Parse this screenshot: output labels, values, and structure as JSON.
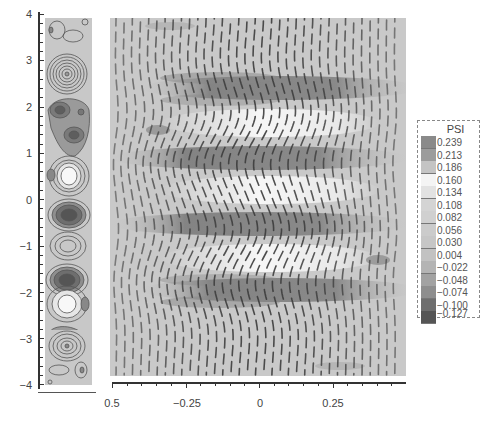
{
  "chart_data": [
    {
      "type": "heatmap",
      "title": "",
      "description": "Narrow contour plot of PSI (streamfunction) with closed contour vortices alternating sign along y",
      "xlabel": "",
      "ylabel": "",
      "y_ticks": [
        "4",
        "3",
        "2",
        "1",
        "0",
        "-1",
        "-2",
        "-3",
        "-4"
      ],
      "ylim": [
        -4,
        4
      ],
      "grid": false,
      "features": [
        {
          "y": 3.2,
          "sign": "negative-dark",
          "type": "vortex"
        },
        {
          "y": 2.5,
          "sign": "dark",
          "type": "vortex"
        },
        {
          "y": 2.1,
          "sign": "dark",
          "type": "vortex"
        },
        {
          "y": 1.5,
          "sign": "positive-light",
          "type": "vortex"
        },
        {
          "y": 0.7,
          "sign": "dark",
          "type": "vortex"
        },
        {
          "y": -0.7,
          "sign": "dark",
          "type": "vortex"
        },
        {
          "y": -1.5,
          "sign": "positive-light",
          "type": "vortex"
        },
        {
          "y": -2.1,
          "sign": "dark",
          "type": "vortex"
        },
        {
          "y": -2.5,
          "sign": "dark",
          "type": "vortex"
        },
        {
          "y": -3.2,
          "sign": "negative-dark",
          "type": "vortex"
        }
      ]
    },
    {
      "type": "heatmap",
      "title": "",
      "description": "Wide contour plot of PSI showing wavy vertical contour lines with dark bands near y=±0.7 and light bands near y=±1.5",
      "xlabel": "",
      "ylabel": "",
      "x_ticks": [
        "0.5",
        "-0.25",
        "0",
        "0.25"
      ],
      "xlim": [
        -0.5,
        0.5
      ],
      "ylim": [
        -4,
        4
      ],
      "grid": false
    }
  ],
  "legend": {
    "title": "PSI",
    "levels": [
      {
        "value": "0.239",
        "color": "#8a8a8a"
      },
      {
        "value": "0.213",
        "color": "#9c9c9c"
      },
      {
        "value": "0.186",
        "color": "#c4c4c4"
      },
      {
        "value": "0.160",
        "color": "#f4f4f4"
      },
      {
        "value": "0.134",
        "color": "#e2e2e2"
      },
      {
        "value": "0.108",
        "color": "#d4d4d4"
      },
      {
        "value": "0.082",
        "color": "#d0d0d0"
      },
      {
        "value": "0.056",
        "color": "#cbcbcb"
      },
      {
        "value": "0.030",
        "color": "#c6c6c6"
      },
      {
        "value": "0.004",
        "color": "#c2c2c2"
      },
      {
        "value": "−0.022",
        "color": "#b4b4b4"
      },
      {
        "value": "−0.048",
        "color": "#a2a2a2"
      },
      {
        "value": "−0.074",
        "color": "#8e8e8e"
      },
      {
        "value": "−0.100",
        "color": "#6e6e6e"
      },
      {
        "value": "−0.127",
        "color": "#555555"
      }
    ]
  },
  "axes": {
    "y_labels": [
      "4",
      "3",
      "2",
      "1",
      "0",
      "−1",
      "−2",
      "−3",
      "−4"
    ],
    "x_labels": [
      "0.5",
      "−0.25",
      "0",
      "0.25"
    ]
  }
}
